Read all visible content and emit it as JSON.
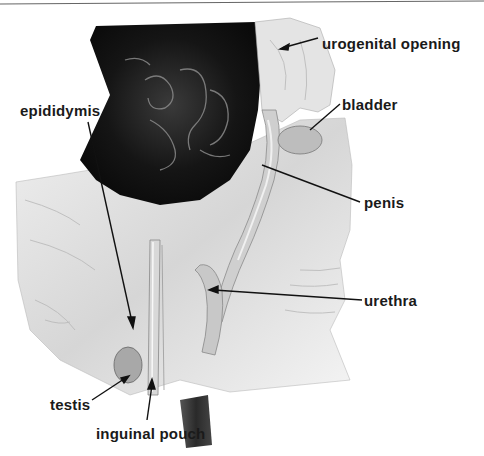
{
  "figure": {
    "labels": [
      {
        "id": "urogenital-opening",
        "text": "urogenital opening",
        "x": 322,
        "y": 35
      },
      {
        "id": "bladder",
        "text": "bladder",
        "x": 342,
        "y": 101
      },
      {
        "id": "epididymis",
        "text": "epididymis",
        "x": 20,
        "y": 106
      },
      {
        "id": "penis",
        "text": "penis",
        "x": 364,
        "y": 200
      },
      {
        "id": "urethra",
        "text": "urethra",
        "x": 364,
        "y": 297
      },
      {
        "id": "testis",
        "text": "testis",
        "x": 50,
        "y": 398
      },
      {
        "id": "inguinal-pouch",
        "text": "inguinal pouch",
        "x": 96,
        "y": 426
      }
    ]
  },
  "colors": {
    "background": "#ffffff",
    "label_text": "#1a1a1a",
    "leader_line": "#111111"
  }
}
